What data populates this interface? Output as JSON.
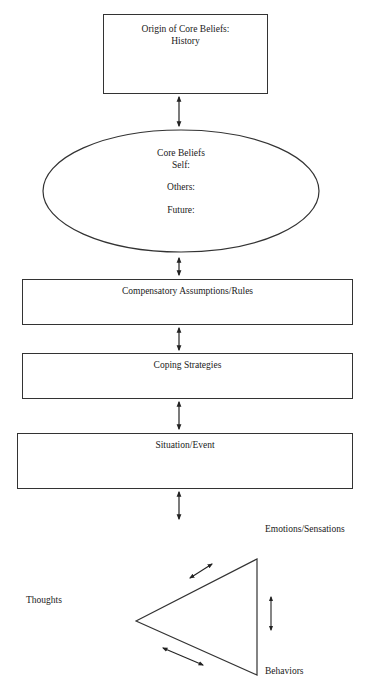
{
  "diagram": {
    "type": "cognitive-conceptualization-diagram",
    "origin_box": {
      "title": "Origin of Core Beliefs:",
      "subtitle": "History"
    },
    "core_beliefs": {
      "title": "Core Beliefs",
      "items": [
        "Self:",
        "Others:",
        "Future:"
      ]
    },
    "assumptions_box": {
      "title": "Compensatory Assumptions/Rules"
    },
    "coping_box": {
      "title": "Coping Strategies"
    },
    "situation_box": {
      "title": "Situation/Event"
    },
    "triangle": {
      "emotions_label": "Emotions/Sensations",
      "thoughts_label": "Thoughts",
      "behaviors_label": "Behaviors"
    },
    "colors": {
      "stroke": "#333333",
      "text": "#1a1a1a",
      "background": "#ffffff"
    }
  }
}
